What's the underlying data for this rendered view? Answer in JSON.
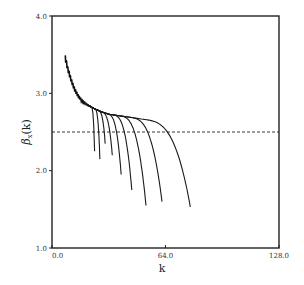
{
  "chart_data": {
    "type": "line",
    "title": "",
    "xlabel": "k",
    "ylabel": "β_x(k)",
    "ylabel_main": "β",
    "ylabel_sub": "x",
    "ylabel_arg": "(k)",
    "xlim": [
      0,
      128
    ],
    "ylim": [
      1.0,
      4.0
    ],
    "x_ticks": [
      0,
      64,
      128
    ],
    "x_tick_labels": [
      "0.0",
      "64.0",
      "128.0"
    ],
    "y_ticks": [
      1.0,
      2.0,
      3.0,
      4.0
    ],
    "y_tick_labels": [
      "1.0",
      "2.0",
      "3.0",
      "4.0"
    ],
    "grid": false,
    "legend": "none",
    "reference_line": {
      "y": 2.5,
      "style": "dashed"
    },
    "envelope": {
      "x": [
        7.5,
        9,
        11,
        13,
        15,
        17,
        20,
        24,
        28,
        32,
        38,
        44,
        50,
        56,
        62
      ],
      "y": [
        3.45,
        3.3,
        3.15,
        3.03,
        2.95,
        2.9,
        2.85,
        2.8,
        2.76,
        2.73,
        2.71,
        2.69,
        2.67,
        2.65,
        2.63
      ]
    },
    "series": [
      {
        "name": "curve-1",
        "break_k": 22,
        "end_k": 24,
        "end_y": 2.25
      },
      {
        "name": "curve-2",
        "break_k": 24,
        "end_k": 27,
        "end_y": 2.15
      },
      {
        "name": "curve-3",
        "break_k": 26,
        "end_k": 30,
        "end_y": 2.35
      },
      {
        "name": "curve-4",
        "break_k": 28,
        "end_k": 34,
        "end_y": 2.2
      },
      {
        "name": "curve-5",
        "break_k": 31,
        "end_k": 39,
        "end_y": 1.95
      },
      {
        "name": "curve-6",
        "break_k": 34,
        "end_k": 45,
        "end_y": 1.75
      },
      {
        "name": "curve-7",
        "break_k": 38,
        "end_k": 53,
        "end_y": 1.55
      },
      {
        "name": "curve-8",
        "break_k": 44,
        "end_k": 62,
        "end_y": 1.6
      },
      {
        "name": "curve-9",
        "break_k": 52,
        "end_k": 78,
        "end_y": 1.53
      }
    ]
  }
}
